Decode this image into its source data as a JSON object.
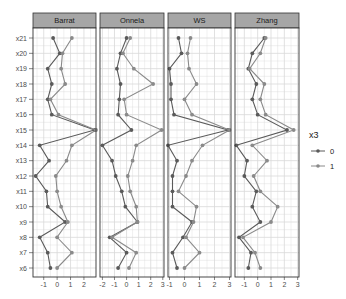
{
  "chart_data": {
    "type": "line",
    "title": "",
    "xlabel": "",
    "ylabel": "",
    "facet_by": "method",
    "panels": [
      "Barrat",
      "Onnela",
      "WS",
      "Zhang"
    ],
    "categories": [
      "x6",
      "x7",
      "x8",
      "x9",
      "x10",
      "x11",
      "x12",
      "x13",
      "x14",
      "x15",
      "x16",
      "x17",
      "x18",
      "x19",
      "x20",
      "x21"
    ],
    "legend": {
      "title": "x3",
      "entries": [
        "0",
        "1"
      ],
      "position": "right"
    },
    "grid": true,
    "facets": [
      {
        "name": "Barrat",
        "xlim": [
          -1.8,
          2.9
        ],
        "xticks": [
          -1,
          0,
          1,
          2
        ],
        "series": [
          {
            "name": "0",
            "values": [
              -0.5,
              -0.7,
              -1.3,
              0.6,
              -0.7,
              -0.8,
              -1.6,
              -0.6,
              -1.3,
              2.8,
              -0.4,
              -0.7,
              -0.4,
              -0.7,
              0.2,
              -0.3
            ]
          },
          {
            "name": "1",
            "values": [
              0.0,
              1.1,
              0.0,
              0.8,
              0.3,
              0.0,
              -0.1,
              0.7,
              1.1,
              2.9,
              0.1,
              -0.5,
              0.6,
              0.3,
              0.4,
              1.1
            ]
          }
        ]
      },
      {
        "name": "Onnela",
        "xlim": [
          -2.2,
          3.1
        ],
        "xticks": [
          -2,
          -1,
          0,
          1,
          2,
          3
        ],
        "series": [
          {
            "name": "0",
            "values": [
              -0.7,
              0.0,
              -1.4,
              0.9,
              -0.1,
              -0.4,
              -0.9,
              -1.2,
              -2.0,
              0.4,
              -0.7,
              -0.6,
              -0.5,
              -0.8,
              -0.5,
              0.0
            ]
          },
          {
            "name": "1",
            "values": [
              0.2,
              0.8,
              -1.2,
              0.9,
              0.8,
              0.3,
              0.1,
              0.5,
              0.8,
              2.9,
              0.0,
              -0.2,
              2.2,
              0.6,
              -0.3,
              0.3
            ]
          }
        ]
      },
      {
        "name": "WS",
        "xlim": [
          -1.1,
          3.1
        ],
        "xticks": [
          -1,
          0,
          1,
          2,
          3
        ],
        "series": [
          {
            "name": "0",
            "values": [
              -0.5,
              -0.8,
              -0.1,
              0.5,
              -0.8,
              -0.8,
              -0.8,
              -0.5,
              -1.1,
              2.9,
              -0.7,
              -0.9,
              -0.9,
              -1.0,
              -0.2,
              -0.4
            ]
          },
          {
            "name": "1",
            "values": [
              0.0,
              1.0,
              0.1,
              0.6,
              0.8,
              -0.4,
              0.1,
              0.5,
              1.2,
              3.0,
              0.5,
              0.0,
              0.8,
              0.3,
              0.2,
              0.4
            ]
          }
        ]
      },
      {
        "name": "Zhang",
        "xlim": [
          -1.7,
          3.1
        ],
        "xticks": [
          -1,
          0,
          1,
          2,
          3
        ],
        "series": [
          {
            "name": "0",
            "values": [
              -0.7,
              -0.5,
              -1.4,
              0.2,
              -0.4,
              -0.1,
              -1.0,
              -0.8,
              -1.6,
              2.2,
              0.0,
              -0.4,
              -0.1,
              -0.7,
              -0.4,
              0.5
            ]
          },
          {
            "name": "1",
            "values": [
              0.2,
              -0.2,
              -1.1,
              1.0,
              1.5,
              0.2,
              -0.3,
              0.7,
              -0.4,
              2.7,
              0.6,
              0.2,
              0.5,
              -0.6,
              0.2,
              0.6
            ]
          }
        ]
      }
    ]
  },
  "colors": {
    "series_0": "#5a5a5a",
    "series_1": "#8a8a8a",
    "strip_bg": "#a6a6a6",
    "panel_border": "#333333",
    "grid": "#d9d9d9"
  }
}
